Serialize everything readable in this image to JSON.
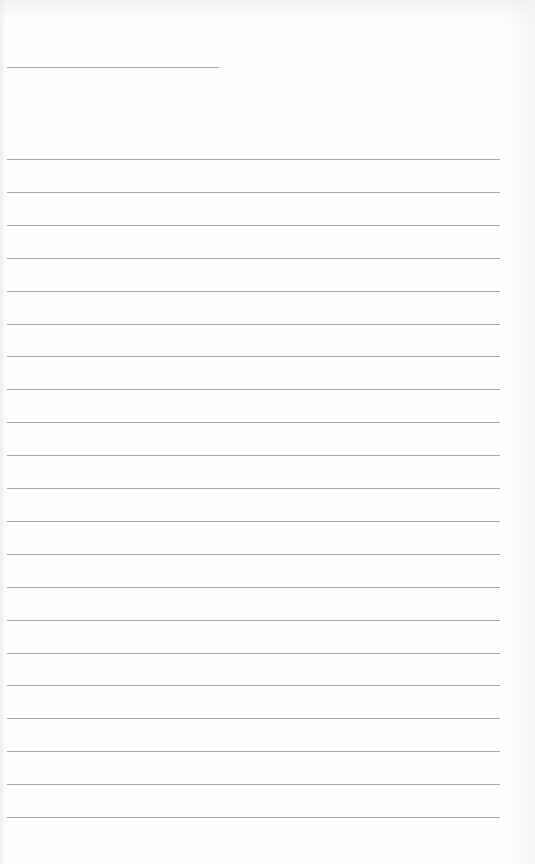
{
  "page": {
    "type": "lined-paper",
    "title_line": {
      "label": ""
    },
    "lines": [
      "",
      "",
      "",
      "",
      "",
      "",
      "",
      "",
      "",
      "",
      "",
      "",
      "",
      "",
      "",
      "",
      "",
      "",
      "",
      "",
      ""
    ]
  }
}
